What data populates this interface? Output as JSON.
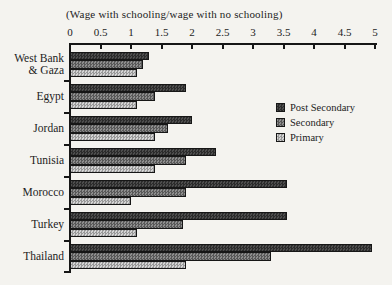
{
  "figure": {
    "background": "#f4f3ef",
    "text_color": "#1c1c1c",
    "axis_color": "#161616"
  },
  "chart_data": {
    "type": "bar",
    "orientation": "horizontal",
    "title": "(Wage with schooling/wage with no schooling)",
    "xlabel": "",
    "ylabel": "",
    "xlim": [
      0,
      5
    ],
    "x_ticks": [
      0,
      0.5,
      1,
      1.5,
      2,
      2.5,
      3,
      3.5,
      4,
      4.5,
      5
    ],
    "x_tick_labels": [
      "0",
      "0.5",
      "1",
      "1.5",
      "2",
      "2.5",
      "3",
      "3.5",
      "4",
      "4.5",
      "5"
    ],
    "grid": false,
    "legend_position": "middle-right",
    "categories": [
      "West Bank\n& Gaza",
      "Egypt",
      "Jordan",
      "Tunisia",
      "Morocco",
      "Turkey",
      "Thailand"
    ],
    "series": [
      {
        "name": "Post Secondary",
        "values": [
          1.3,
          1.9,
          2.0,
          2.4,
          3.55,
          3.55,
          4.95
        ],
        "color": "#3a3a3a",
        "pattern_dark": "#2b2b2b",
        "pattern_light": "#4d4d4d"
      },
      {
        "name": "Secondary",
        "values": [
          1.2,
          1.4,
          1.6,
          1.9,
          1.9,
          1.85,
          3.3
        ],
        "color": "#717171",
        "pattern_dark": "#585858",
        "pattern_light": "#8d8d8d"
      },
      {
        "name": "Primary",
        "values": [
          1.1,
          1.1,
          1.4,
          1.4,
          1.0,
          1.1,
          1.9
        ],
        "color": "#b5b5b5",
        "pattern_dark": "#989898",
        "pattern_light": "#d3d3d3"
      }
    ]
  }
}
